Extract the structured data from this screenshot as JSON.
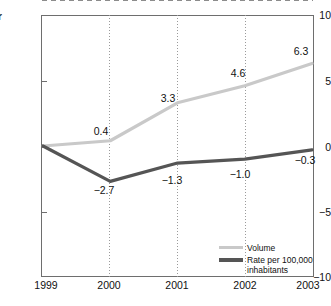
{
  "axis": {
    "clipped_left_label": "r",
    "y_ticks": [
      "10",
      "5",
      "0",
      "−5",
      "−10"
    ],
    "x_ticks": [
      "1999",
      "2000",
      "2001",
      "2002",
      "2003"
    ]
  },
  "legend": {
    "items": [
      {
        "label": "Volume",
        "color": "#c9c9c9"
      },
      {
        "label": "Rate per 100,000\ninhabitants",
        "color": "#555555"
      }
    ]
  },
  "labels": {
    "volume": [
      "",
      "0.4",
      "3.3",
      "4.6",
      "6.3"
    ],
    "rate": [
      "",
      "−2.7",
      "−1.3",
      "−1.0",
      "−0.3"
    ]
  },
  "chart_data": {
    "type": "line",
    "title": "",
    "xlabel": "",
    "ylabel": "",
    "x": [
      1999,
      2000,
      2001,
      2002,
      2003
    ],
    "categories": [
      "1999",
      "2000",
      "2001",
      "2002",
      "2003"
    ],
    "ylim": [
      -10,
      10
    ],
    "y_ticks": [
      10,
      5,
      0,
      -5,
      -10
    ],
    "grid": "vertical-dotted",
    "zero_reference_line": true,
    "legend_position": "bottom-right",
    "series": [
      {
        "name": "Volume",
        "color": "#c9c9c9",
        "values": [
          0.0,
          0.4,
          3.3,
          4.6,
          6.3
        ],
        "point_labels": [
          "",
          "0.4",
          "3.3",
          "4.6",
          "6.3"
        ]
      },
      {
        "name": "Rate per 100,000 inhabitants",
        "color": "#555555",
        "values": [
          0.0,
          -2.7,
          -1.3,
          -1.0,
          -0.3
        ],
        "point_labels": [
          "",
          "−2.7",
          "−1.3",
          "−1.0",
          "−0.3"
        ]
      }
    ]
  }
}
